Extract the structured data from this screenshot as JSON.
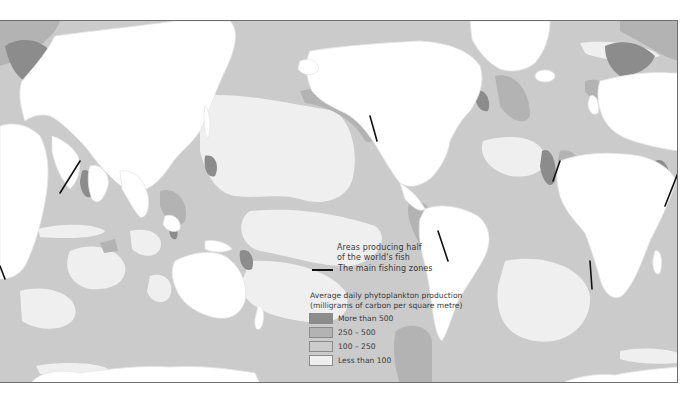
{
  "map": {
    "title": "World ocean phytoplankton production and main fishing zones",
    "colors": {
      "land": "#ffffff",
      "more_than_500": "#8c8c8c",
      "from_250_to_500": "#b3b3b3",
      "from_100_to_250": "#cbcbcb",
      "less_than_100": "#efefef",
      "fishing_zone_line": "#111111",
      "coast_outline": "#ffffff"
    }
  },
  "legend": {
    "half_fish_label_line1": "Areas producing half",
    "half_fish_label_line2": "of the world's fish",
    "fishing_zones_label": "The main fishing zones",
    "production_title_line1": "Average daily phytoplankton production",
    "production_title_line2": "(milligrams of carbon per square metre)",
    "classes": [
      {
        "label": "More than 500",
        "color": "#8c8c8c"
      },
      {
        "label": "250 – 500",
        "color": "#b3b3b3"
      },
      {
        "label": "100 – 250",
        "color": "#cbcbcb"
      },
      {
        "label": "Less than 100",
        "color": "#efefef"
      }
    ]
  }
}
